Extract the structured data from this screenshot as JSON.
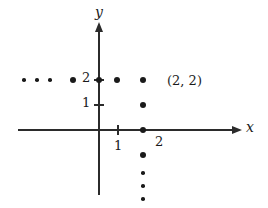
{
  "figure": {
    "type": "coordinate-plane-scatter",
    "background_color": "#ffffff",
    "ink_color": "#1a1a1a"
  },
  "axes": {
    "x_axis": {
      "label": "x",
      "y_pixel": 130,
      "x_start_pixel": 18,
      "x_end_pixel": 232,
      "arrow": "right"
    },
    "y_axis": {
      "label": "y",
      "x_pixel": 99,
      "y_start_pixel": 195,
      "y_end_pixel": 32,
      "arrow": "up"
    },
    "origin_pixel": [
      99,
      130
    ],
    "unit_pixels": 25
  },
  "ticks": {
    "x": [
      {
        "label": "1",
        "value": 1,
        "x_pixel": 118
      }
    ],
    "y": [
      {
        "label": "1",
        "value": 1,
        "y_pixel": 105
      },
      {
        "label": "2",
        "value": 2,
        "y_pixel": 80
      }
    ]
  },
  "labels": {
    "highlighted_point": "(2, 2)",
    "below_axis_two": "2"
  },
  "chart_data": {
    "type": "scatter",
    "title": "",
    "xlabel": "x",
    "ylabel": "y",
    "xlim": [
      -3.5,
      5.5
    ],
    "ylim": [
      -3.0,
      3.0
    ],
    "grid": false,
    "legend": false,
    "annotations": [
      {
        "text": "(2, 2)",
        "x": 2,
        "y": 2,
        "offset_px": [
          18,
          -7
        ]
      },
      {
        "text": "2",
        "x": 2,
        "y": -0.3,
        "offset_px": [
          6,
          -4
        ]
      }
    ],
    "series": [
      {
        "name": "row-y-equals-2",
        "description": "Horizontal row of lattice points at y = 2 extending left with ellipsis",
        "points": [
          {
            "x": -3.0,
            "y": 2,
            "radius_px": 1.8,
            "kind": "ellipsis"
          },
          {
            "x": -2.48,
            "y": 2,
            "radius_px": 1.8,
            "kind": "ellipsis"
          },
          {
            "x": -1.96,
            "y": 2,
            "radius_px": 1.8,
            "kind": "ellipsis"
          },
          {
            "x": -1.04,
            "y": 2,
            "radius_px": 3.0,
            "kind": "point"
          },
          {
            "x": 0,
            "y": 2,
            "radius_px": 3.0,
            "kind": "point"
          },
          {
            "x": 0.72,
            "y": 2,
            "radius_px": 3.0,
            "kind": "point"
          },
          {
            "x": 1.76,
            "y": 2,
            "radius_px": 3.0,
            "kind": "point"
          }
        ]
      },
      {
        "name": "column-x-equals-2",
        "description": "Vertical column of lattice points at x = 2 extending down with ellipsis",
        "points": [
          {
            "x": 1.76,
            "y": 1,
            "radius_px": 3.0,
            "kind": "point"
          },
          {
            "x": 1.76,
            "y": 0,
            "radius_px": 3.0,
            "kind": "point"
          },
          {
            "x": 1.76,
            "y": -1.0,
            "radius_px": 3.0,
            "kind": "point"
          },
          {
            "x": 1.76,
            "y": -1.72,
            "radius_px": 1.8,
            "kind": "ellipsis"
          },
          {
            "x": 1.76,
            "y": -2.24,
            "radius_px": 1.8,
            "kind": "ellipsis"
          },
          {
            "x": 1.76,
            "y": -2.76,
            "radius_px": 1.8,
            "kind": "ellipsis"
          }
        ]
      }
    ]
  }
}
